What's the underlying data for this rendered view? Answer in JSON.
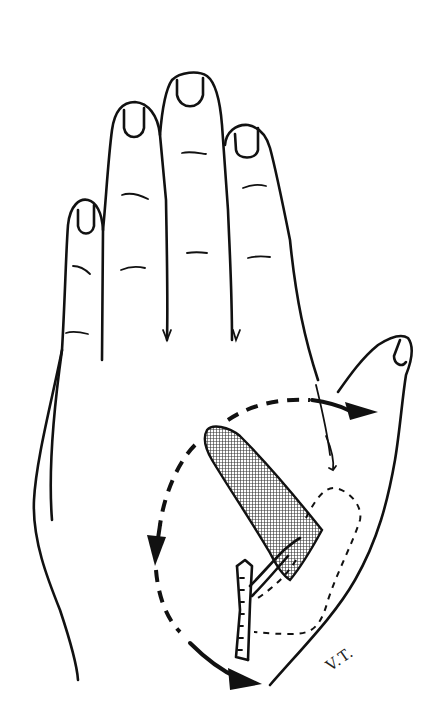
{
  "figure": {
    "signature": "V.T.",
    "colors": {
      "ink": "#111111",
      "background": "#ffffff",
      "hatch": "#333333"
    },
    "elements": {
      "fingers": [
        "little-finger",
        "ring-finger",
        "middle-finger",
        "index-finger"
      ],
      "thumb": "thumb",
      "flap": "hatched-flap",
      "vessel": "pedicle-vessel",
      "donor_outline": "dashed-donor-outline",
      "rotation_arcs": [
        "upper-arc-to-thumb",
        "left-arc-downward",
        "lower-arc-to-wrist"
      ]
    }
  }
}
